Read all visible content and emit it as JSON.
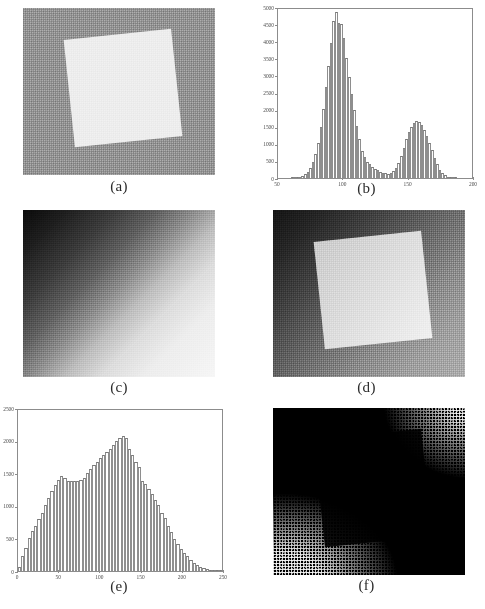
{
  "figure": {
    "layout": "2 columns x 3 rows of subfigures",
    "panels": [
      {
        "id": "a",
        "caption": "(a)",
        "type": "image",
        "description": "noisy gray background with bright rotated square"
      },
      {
        "id": "b",
        "caption": "(b)",
        "type": "histogram"
      },
      {
        "id": "c",
        "caption": "(c)",
        "type": "image",
        "description": "diagonal intensity ramp, dark upper-left to bright lower-right"
      },
      {
        "id": "d",
        "caption": "(d)",
        "type": "image",
        "description": "rotated bright square over diagonal ramp with noise"
      },
      {
        "id": "e",
        "caption": "(e)",
        "type": "histogram"
      },
      {
        "id": "f",
        "caption": "(f)",
        "type": "image",
        "description": "binary thresholded result, mostly black with white speckle at lower-left and upper-right"
      }
    ]
  },
  "chart_data": [
    {
      "panel": "b",
      "type": "bar",
      "title": "",
      "xlabel": "",
      "ylabel": "",
      "xlim": [
        50,
        200
      ],
      "ylim": [
        0,
        5000
      ],
      "xticks": [
        50,
        100,
        150,
        200
      ],
      "yticks": [
        0,
        500,
        1000,
        1500,
        2000,
        2500,
        3000,
        3500,
        4000,
        4500,
        5000
      ],
      "grid": false,
      "legend": "none",
      "bin_width": 2,
      "categories": [
        50,
        52,
        54,
        56,
        58,
        60,
        62,
        64,
        66,
        68,
        70,
        72,
        74,
        76,
        78,
        80,
        82,
        84,
        86,
        88,
        90,
        92,
        94,
        96,
        98,
        100,
        102,
        104,
        106,
        108,
        110,
        112,
        114,
        116,
        118,
        120,
        122,
        124,
        126,
        128,
        130,
        132,
        134,
        136,
        138,
        140,
        142,
        144,
        146,
        148,
        150,
        152,
        154,
        156,
        158,
        160,
        162,
        164,
        166,
        168,
        170,
        172,
        174,
        176,
        178,
        180,
        182,
        184,
        186,
        188,
        190,
        192,
        194,
        196,
        198
      ],
      "values": [
        0,
        0,
        0,
        0,
        0,
        5,
        10,
        20,
        35,
        60,
        110,
        180,
        300,
        470,
        700,
        1050,
        1500,
        2050,
        2700,
        3300,
        4000,
        4650,
        4900,
        4600,
        4550,
        4150,
        3550,
        3000,
        2500,
        2000,
        1550,
        1150,
        800,
        620,
        480,
        400,
        330,
        280,
        230,
        190,
        160,
        140,
        130,
        150,
        200,
        300,
        450,
        650,
        900,
        1150,
        1350,
        1500,
        1620,
        1680,
        1650,
        1560,
        1420,
        1250,
        1050,
        830,
        600,
        400,
        250,
        150,
        80,
        40,
        20,
        10,
        5,
        0,
        0,
        0,
        0,
        0,
        0
      ]
    },
    {
      "panel": "e",
      "type": "bar",
      "title": "",
      "xlabel": "",
      "ylabel": "",
      "xlim": [
        0,
        250
      ],
      "ylim": [
        0,
        2500
      ],
      "xticks": [
        0,
        50,
        100,
        150,
        200,
        250
      ],
      "yticks": [
        0,
        500,
        1000,
        1500,
        2000,
        2500
      ],
      "grid": false,
      "legend": "none",
      "bin_width": 4,
      "categories": [
        0,
        4,
        8,
        12,
        16,
        20,
        24,
        28,
        32,
        36,
        40,
        44,
        48,
        52,
        56,
        60,
        64,
        68,
        72,
        76,
        80,
        84,
        88,
        92,
        96,
        100,
        104,
        108,
        112,
        116,
        120,
        124,
        128,
        132,
        136,
        140,
        144,
        148,
        152,
        156,
        160,
        164,
        168,
        172,
        176,
        180,
        184,
        188,
        192,
        196,
        200,
        204,
        208,
        212,
        216,
        220,
        224,
        228,
        232,
        236,
        240,
        244,
        248
      ],
      "values": [
        60,
        230,
        360,
        520,
        620,
        700,
        800,
        900,
        1020,
        1130,
        1250,
        1330,
        1420,
        1480,
        1450,
        1400,
        1390,
        1400,
        1400,
        1420,
        1450,
        1520,
        1580,
        1640,
        1700,
        1760,
        1800,
        1850,
        1900,
        1950,
        2020,
        2060,
        2090,
        2060,
        1900,
        1800,
        1700,
        1620,
        1400,
        1350,
        1280,
        1200,
        1100,
        1030,
        900,
        820,
        700,
        600,
        500,
        420,
        340,
        280,
        230,
        170,
        130,
        90,
        60,
        40,
        25,
        15,
        8,
        4,
        2
      ]
    }
  ]
}
